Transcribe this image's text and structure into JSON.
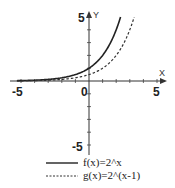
{
  "chart_data": {
    "type": "line",
    "title": "",
    "xlabel": "X",
    "ylabel": "Y",
    "xlim": [
      -5.0,
      5.0
    ],
    "ylim": [
      -5.0,
      5.0
    ],
    "xticks": [
      -5,
      0,
      5
    ],
    "yticks": [
      -5,
      5
    ],
    "x_tick_labels": [
      "-5",
      "0",
      "5"
    ],
    "y_tick_labels": [
      "5",
      "-5"
    ],
    "grid": false,
    "legend_position": "bottom",
    "series": [
      {
        "name": "f(x)=2^x",
        "style": "solid",
        "color": "#222222",
        "x": [
          -5,
          -4,
          -3,
          -2,
          -1,
          0,
          1,
          2,
          2.32
        ],
        "values": [
          0.03,
          0.06,
          0.13,
          0.25,
          0.5,
          1,
          2,
          4,
          5
        ]
      },
      {
        "name": "g(x)=2^(x-1)",
        "style": "dashed",
        "color": "#222222",
        "x": [
          -5,
          -4,
          -3,
          -2,
          -1,
          0,
          1,
          2,
          3,
          3.32
        ],
        "values": [
          0.02,
          0.03,
          0.06,
          0.13,
          0.25,
          0.5,
          1,
          2,
          4,
          5
        ]
      }
    ]
  },
  "axes": {
    "x_name": "X",
    "y_name": "Y",
    "label_x_neg5": "-5",
    "label_x_0": "0",
    "label_x_5": "5",
    "label_y_5": "5",
    "label_y_neg5": "-5"
  },
  "legend": {
    "f_label": "f(x)=2^x",
    "g_label": "g(x)=2^(x-1)"
  }
}
